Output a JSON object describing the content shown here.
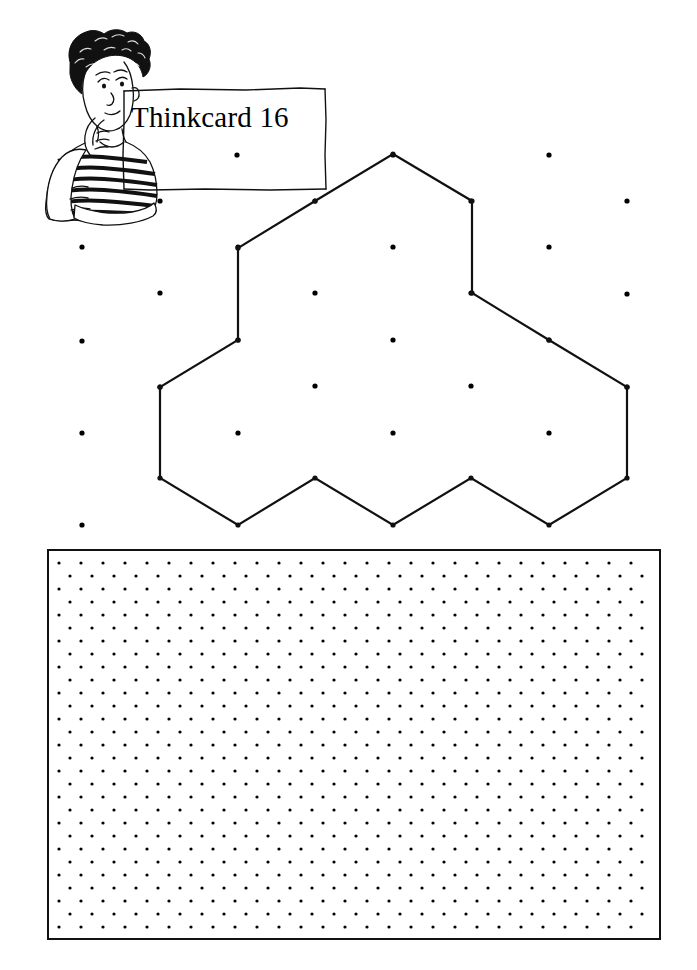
{
  "document": {
    "type": "math-worksheet",
    "title": "Thinkcard 16",
    "card_number": "16",
    "background_color": "#ffffff",
    "ink_color": "#000000",
    "width": 697,
    "height": 970
  },
  "header": {
    "title": "Thinkcard 16",
    "title_box": {
      "style": "hand-drawn-rectangle",
      "x": 123,
      "y": 88,
      "width": 203,
      "height": 102
    },
    "mascot": {
      "icon": "thinking-boy-icon",
      "description": "cartoon boy with curly hair resting chin on hand, wearing striped shirt",
      "x": 35,
      "y": 30,
      "width": 130,
      "height": 190
    }
  },
  "figure": {
    "name": "tri-hexagon-shape",
    "hexagon_count": 3,
    "lattice": {
      "type": "hexagon-centre-lattice",
      "dot_radius": 2.6,
      "dot_color": "#000000",
      "column_spacing": 78,
      "row_spacing": 46,
      "dots": [
        [
          160,
          201
        ],
        [
          237,
          155
        ],
        [
          315,
          201
        ],
        [
          393,
          155
        ],
        [
          471,
          201
        ],
        [
          549,
          155
        ],
        [
          627,
          201
        ],
        [
          82,
          247
        ],
        [
          160,
          293
        ],
        [
          238,
          247
        ],
        [
          315,
          293
        ],
        [
          393,
          247
        ],
        [
          471,
          293
        ],
        [
          549,
          247
        ],
        [
          627,
          294
        ],
        [
          82,
          341
        ],
        [
          160,
          387
        ],
        [
          238,
          340
        ],
        [
          315,
          386
        ],
        [
          393,
          340
        ],
        [
          471,
          386
        ],
        [
          549,
          340
        ],
        [
          627,
          387
        ],
        [
          82,
          433
        ],
        [
          238,
          433
        ],
        [
          393,
          433
        ],
        [
          549,
          433
        ],
        [
          82,
          525
        ]
      ]
    },
    "polygon": {
      "stroke": "#111111",
      "stroke_width": 2.2,
      "fill": "none",
      "vertex_dot_radius": 2.6,
      "vertices": [
        [
          393,
          154
        ],
        [
          472,
          201
        ],
        [
          472,
          293
        ],
        [
          549,
          340
        ],
        [
          627,
          387
        ],
        [
          627,
          478
        ],
        [
          549,
          525
        ],
        [
          471,
          478
        ],
        [
          393,
          525
        ],
        [
          315,
          478
        ],
        [
          238,
          525
        ],
        [
          160,
          478
        ],
        [
          160,
          387
        ],
        [
          238,
          340
        ],
        [
          238,
          248
        ],
        [
          315,
          201
        ]
      ]
    }
  },
  "work_area": {
    "name": "isometric-dot-grid-panel",
    "border_color": "#111111",
    "border_width": 2,
    "background": "#ffffff",
    "x": 47,
    "y": 549,
    "width": 614,
    "height": 391,
    "grid": {
      "type": "isometric-triangular-dot-lattice",
      "dot_radius": 1.6,
      "dot_color": "#000000",
      "column_spacing": 22,
      "row_spacing": 13,
      "row_offset": 11,
      "columns": 28,
      "rows": 30
    }
  }
}
